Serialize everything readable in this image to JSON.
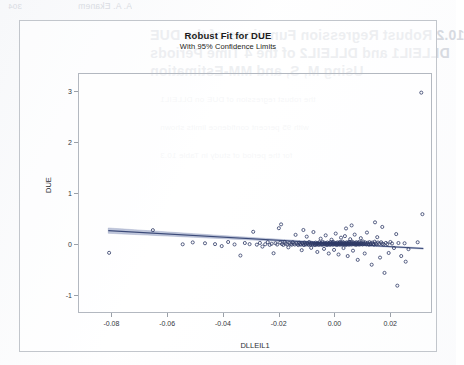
{
  "page": {
    "ghost_text": {
      "header_number": "304",
      "header_name": "A. A. Ekanem",
      "line1": "10.2  Robust Regression Functions of the DUE",
      "line2": "DLLEIL1 and DLLEIL2 of the 4 Time Periods",
      "line3": "Using M, S, and MM-Estimation",
      "line4": "the robust regression of DUE on DLLEIL1",
      "line5": "with 95 percent confidence limits shown",
      "line6": "for the period of study in Table 10.3"
    }
  },
  "chart_data": {
    "type": "scatter",
    "title": "Robust Fit for DUE",
    "subtitle": "With 95% Confidence Limits",
    "xlabel": "DLLEIL1",
    "ylabel": "DUE",
    "xlim": [
      -0.092,
      0.035
    ],
    "ylim": [
      -1.35,
      3.35
    ],
    "xticks": [
      -0.08,
      -0.06,
      -0.04,
      -0.02,
      0.0,
      0.02
    ],
    "xticklabels": [
      "-0.08",
      "-0.06",
      "-0.04",
      "-0.02",
      "0.00",
      "0.02"
    ],
    "yticks": [
      -1,
      0,
      1,
      2,
      3
    ],
    "yticklabels": [
      "-1",
      "0",
      "1",
      "2",
      "3"
    ],
    "grid": false,
    "legend": false,
    "marker": {
      "shape": "open-circle",
      "color": "#2e3a66",
      "size": 3.1,
      "stroke_width": 0.8
    },
    "fit_line": {
      "name": "Robust regression fit",
      "color": "#3b4a78",
      "width": 1.1,
      "intercept": 0.03,
      "slope": -3.1,
      "x_start": -0.0815,
      "x_end": 0.0315,
      "y_start": 0.283,
      "y_end": -0.068
    },
    "confidence_band": {
      "name": "95% confidence limits",
      "level": 95,
      "fill": "#8d99bd",
      "fill_opacity": 0.55,
      "half_width_left": 0.052,
      "half_width_center": 0.012,
      "half_width_right": 0.021
    },
    "series": [
      {
        "name": "DUE vs DLLEIL1",
        "n_points": 214,
        "points": [
          [
            -0.0812,
            -0.152
          ],
          [
            -0.0655,
            0.292
          ],
          [
            -0.0548,
            0.015
          ],
          [
            -0.0512,
            0.052
          ],
          [
            -0.0468,
            0.035
          ],
          [
            -0.0432,
            0.018
          ],
          [
            -0.0408,
            -0.02
          ],
          [
            -0.0385,
            0.06
          ],
          [
            -0.0362,
            0.012
          ],
          [
            -0.0341,
            -0.205
          ],
          [
            -0.0325,
            0.04
          ],
          [
            -0.0308,
            0.018
          ],
          [
            -0.0295,
            0.26
          ],
          [
            -0.0282,
            0.008
          ],
          [
            -0.0271,
            0.042
          ],
          [
            -0.0262,
            -0.03
          ],
          [
            -0.0252,
            0.016
          ],
          [
            -0.0243,
            0.058
          ],
          [
            -0.0236,
            0.004
          ],
          [
            -0.0229,
            0.024
          ],
          [
            -0.0222,
            -0.16
          ],
          [
            -0.0215,
            0.036
          ],
          [
            -0.0209,
            0.01
          ],
          [
            -0.0203,
            0.33
          ],
          [
            -0.0198,
            0.048
          ],
          [
            -0.0192,
            0.02
          ],
          [
            -0.0187,
            0.002
          ],
          [
            -0.0182,
            0.062
          ],
          [
            -0.0178,
            0.028
          ],
          [
            -0.0173,
            0.012
          ],
          [
            -0.0169,
            -0.045
          ],
          [
            -0.0165,
            0.04
          ],
          [
            -0.0161,
            0.018
          ],
          [
            -0.0157,
            0.006
          ],
          [
            -0.0153,
            0.055
          ],
          [
            -0.015,
            0.026
          ],
          [
            -0.0146,
            0.01
          ],
          [
            -0.0143,
            0.2
          ],
          [
            -0.014,
            0.035
          ],
          [
            -0.0136,
            0.014
          ],
          [
            -0.0133,
            0.0
          ],
          [
            -0.013,
            0.046
          ],
          [
            -0.0127,
            0.022
          ],
          [
            -0.0124,
            0.008
          ],
          [
            -0.0121,
            -0.1
          ],
          [
            -0.0119,
            0.032
          ],
          [
            -0.0116,
            0.013
          ],
          [
            -0.0113,
            0.0
          ],
          [
            -0.0111,
            0.05
          ],
          [
            -0.0108,
            0.024
          ],
          [
            -0.0106,
            0.01
          ],
          [
            -0.0103,
            0.165
          ],
          [
            -0.0101,
            0.038
          ],
          [
            -0.0098,
            0.016
          ],
          [
            -0.0096,
            0.002
          ],
          [
            -0.0094,
            0.06
          ],
          [
            -0.0092,
            0.028
          ],
          [
            -0.0089,
            0.012
          ],
          [
            -0.0087,
            -0.055
          ],
          [
            -0.0085,
            0.042
          ],
          [
            -0.0083,
            0.02
          ],
          [
            -0.0081,
            0.005
          ],
          [
            -0.0079,
            0.255
          ],
          [
            -0.0077,
            0.034
          ],
          [
            -0.0075,
            0.015
          ],
          [
            -0.0073,
            0.0
          ],
          [
            -0.0071,
            0.048
          ],
          [
            -0.0069,
            0.024
          ],
          [
            -0.0067,
            0.009
          ],
          [
            -0.0065,
            -0.135
          ],
          [
            -0.0063,
            0.038
          ],
          [
            -0.0062,
            0.018
          ],
          [
            -0.006,
            0.003
          ],
          [
            -0.0058,
            0.056
          ],
          [
            -0.0056,
            0.027
          ],
          [
            -0.0054,
            0.011
          ],
          [
            -0.0053,
            0.125
          ],
          [
            -0.0051,
            0.04
          ],
          [
            -0.0049,
            0.02
          ],
          [
            -0.0048,
            0.005
          ],
          [
            -0.0046,
            0.062
          ],
          [
            -0.0044,
            0.03
          ],
          [
            -0.0043,
            0.013
          ],
          [
            -0.0041,
            -0.075
          ],
          [
            -0.0039,
            0.044
          ],
          [
            -0.0038,
            0.022
          ],
          [
            -0.0036,
            0.007
          ],
          [
            -0.0035,
            0.19
          ],
          [
            -0.0033,
            0.036
          ],
          [
            -0.0032,
            0.017
          ],
          [
            -0.003,
            0.002
          ],
          [
            -0.0029,
            0.05
          ],
          [
            -0.0027,
            0.026
          ],
          [
            -0.0026,
            0.011
          ],
          [
            -0.0024,
            -0.165
          ],
          [
            -0.0023,
            0.04
          ],
          [
            -0.0021,
            0.02
          ],
          [
            -0.002,
            0.005
          ],
          [
            -0.0018,
            0.058
          ],
          [
            -0.0017,
            0.029
          ],
          [
            -0.0016,
            0.013
          ],
          [
            -0.0014,
            0.105
          ],
          [
            -0.0013,
            0.043
          ],
          [
            -0.0011,
            0.021
          ],
          [
            -0.001,
            0.006
          ],
          [
            -0.0009,
            0.064
          ],
          [
            -0.0007,
            0.032
          ],
          [
            -0.0006,
            0.015
          ],
          [
            -0.0005,
            -0.095
          ],
          [
            -0.0003,
            0.046
          ],
          [
            -0.0002,
            0.023
          ],
          [
            0.0,
            0.008
          ],
          [
            0.0001,
            0.225
          ],
          [
            0.0003,
            0.038
          ],
          [
            0.0004,
            0.018
          ],
          [
            0.0005,
            0.003
          ],
          [
            0.0007,
            0.052
          ],
          [
            0.0008,
            0.027
          ],
          [
            0.0009,
            0.012
          ],
          [
            0.0011,
            -0.185
          ],
          [
            0.0012,
            0.042
          ],
          [
            0.0013,
            0.021
          ],
          [
            0.0015,
            0.006
          ],
          [
            0.0016,
            0.06
          ],
          [
            0.0017,
            0.03
          ],
          [
            0.0019,
            0.014
          ],
          [
            0.002,
            0.145
          ],
          [
            0.0021,
            0.045
          ],
          [
            0.0022,
            0.023
          ],
          [
            0.0024,
            0.008
          ],
          [
            0.0025,
            0.066
          ],
          [
            0.0026,
            0.034
          ],
          [
            0.0028,
            0.016
          ],
          [
            0.0029,
            -0.058
          ],
          [
            0.003,
            0.048
          ],
          [
            0.0032,
            0.025
          ],
          [
            0.0033,
            0.01
          ],
          [
            0.0034,
            0.175
          ],
          [
            0.0036,
            0.04
          ],
          [
            0.0037,
            0.019
          ],
          [
            0.0038,
            0.004
          ],
          [
            0.004,
            0.054
          ],
          [
            0.0041,
            0.028
          ],
          [
            0.0042,
            0.013
          ],
          [
            0.0044,
            -0.215
          ],
          [
            0.0045,
            0.044
          ],
          [
            0.0046,
            0.022
          ],
          [
            0.0048,
            0.007
          ],
          [
            0.0049,
            0.062
          ],
          [
            0.005,
            0.031
          ],
          [
            0.0052,
            0.015
          ],
          [
            0.0053,
            0.115
          ],
          [
            0.0055,
            0.047
          ],
          [
            0.0056,
            0.024
          ],
          [
            0.0057,
            0.009
          ],
          [
            0.0059,
            0.068
          ],
          [
            0.006,
            0.035
          ],
          [
            0.0062,
            0.017
          ],
          [
            0.0063,
            -0.11
          ],
          [
            0.0065,
            0.05
          ],
          [
            0.0066,
            0.026
          ],
          [
            0.0068,
            0.011
          ],
          [
            0.0069,
            0.205
          ],
          [
            0.0071,
            0.042
          ],
          [
            0.0072,
            0.02
          ],
          [
            0.0074,
            0.005
          ],
          [
            0.0075,
            0.056
          ],
          [
            0.0077,
            0.029
          ],
          [
            0.0078,
            0.014
          ],
          [
            0.008,
            -0.29
          ],
          [
            0.0081,
            0.046
          ],
          [
            0.0083,
            0.023
          ],
          [
            0.0085,
            0.008
          ],
          [
            0.0086,
            0.064
          ],
          [
            0.0088,
            0.033
          ],
          [
            0.009,
            0.016
          ],
          [
            0.0091,
            0.135
          ],
          [
            0.0093,
            0.049
          ],
          [
            0.0095,
            0.025
          ],
          [
            0.0097,
            0.01
          ],
          [
            0.0099,
            0.07
          ],
          [
            0.0101,
            0.036
          ],
          [
            0.0103,
            0.018
          ],
          [
            0.0105,
            -0.165
          ],
          [
            0.0107,
            0.052
          ],
          [
            0.0109,
            0.027
          ],
          [
            0.0111,
            0.012
          ],
          [
            0.0113,
            0.245
          ],
          [
            0.0115,
            0.044
          ],
          [
            0.0118,
            0.021
          ],
          [
            0.012,
            0.006
          ],
          [
            0.0122,
            0.058
          ],
          [
            0.0125,
            0.03
          ],
          [
            0.0127,
            0.014
          ],
          [
            0.013,
            -0.385
          ],
          [
            0.0132,
            0.048
          ],
          [
            0.0135,
            0.024
          ],
          [
            0.0138,
            0.009
          ],
          [
            0.0141,
            0.066
          ],
          [
            0.0144,
            0.034
          ],
          [
            0.0147,
            0.016
          ],
          [
            0.015,
            0.155
          ],
          [
            0.0153,
            0.05
          ],
          [
            0.0157,
            0.026
          ],
          [
            0.016,
            -0.245
          ],
          [
            0.0164,
            0.055
          ],
          [
            0.0168,
            0.028
          ],
          [
            0.0172,
            0.012
          ],
          [
            0.0176,
            -0.545
          ],
          [
            0.0181,
            0.042
          ],
          [
            0.0186,
            0.02
          ],
          [
            0.0191,
            -0.155
          ],
          [
            0.0197,
            0.06
          ],
          [
            0.0203,
            0.03
          ],
          [
            0.021,
            -0.058
          ],
          [
            0.0218,
            0.215
          ],
          [
            0.0226,
            0.04
          ],
          [
            0.0236,
            -0.215
          ],
          [
            0.0248,
            0.035
          ],
          [
            0.0262,
            -0.08
          ],
          [
            0.0222,
            -0.795
          ],
          [
            0.0252,
            -0.325
          ],
          [
            0.0295,
            0.055
          ],
          [
            0.0308,
            2.985
          ],
          [
            0.0312,
            0.605
          ],
          [
            0.0142,
            0.445
          ],
          [
            0.0058,
            0.385
          ],
          [
            -0.0195,
            0.405
          ],
          [
            0.0038,
            0.325
          ],
          [
            0.0168,
            0.355
          ],
          [
            -0.0115,
            0.295
          ]
        ]
      }
    ]
  }
}
